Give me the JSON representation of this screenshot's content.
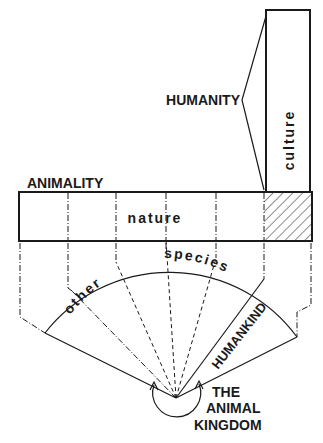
{
  "diagram": {
    "labels": {
      "humanity": "HUMANITY",
      "culture": "culture",
      "animality": "ANIMALITY",
      "nature": "nature",
      "other": "other",
      "species": "species",
      "humankind": "HUMANKIND",
      "animal_kingdom_line1": "THE",
      "animal_kingdom_line2": "ANIMAL",
      "animal_kingdom_line3": "KINGDOM"
    },
    "colors": {
      "ink": "#1a1a1a",
      "background": "#ffffff"
    }
  }
}
